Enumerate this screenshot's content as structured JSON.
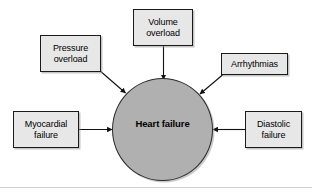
{
  "figure": {
    "center": {
      "label": "Heart failure",
      "fill_color": "#b0b0b0",
      "border_color": "#2b2b2b"
    },
    "box_style": {
      "fill_color": "#e7e7e7",
      "border_color": "#1a1a1a",
      "text_color": "#000000"
    },
    "nodes": [
      {
        "id": "volume-overload",
        "label": "Volume\noverload",
        "position": "top",
        "arrow_direction": "down"
      },
      {
        "id": "pressure-overload",
        "label": "Pressure\noverload",
        "position": "top-left",
        "arrow_direction": "down-right"
      },
      {
        "id": "arrhythmias",
        "label": "Arrhythmias",
        "position": "top-right",
        "arrow_direction": "down-left"
      },
      {
        "id": "myocardial-failure",
        "label": "Myocardial\nfailure",
        "position": "left",
        "arrow_direction": "right"
      },
      {
        "id": "diastolic-failure",
        "label": "Diastolic\nfailure",
        "position": "right",
        "arrow_direction": "left"
      }
    ]
  }
}
